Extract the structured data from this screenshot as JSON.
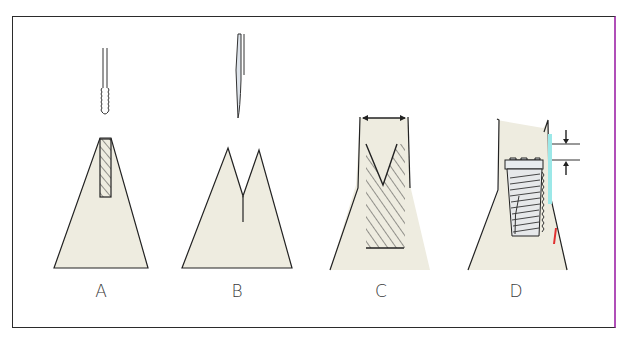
{
  "figure": {
    "panels": [
      {
        "id": "A",
        "label": "A",
        "description": "Narrow bone ridge with pilot osteotomy and drill/tap above"
      },
      {
        "id": "B",
        "label": "B",
        "description": "Ridge split with chisel/osteotome creating V-shaped split"
      },
      {
        "id": "C",
        "label": "C",
        "description": "Expanded ridge with widened width indicated by double-headed arrow and hatched osteotomy"
      },
      {
        "id": "D",
        "label": "D",
        "description": "Tapered threaded implant placed in expanded ridge with subcrestal depth arrows"
      }
    ],
    "colors": {
      "bone_fill": "#eeece0",
      "line": "#222222",
      "frame_border": "#2b2b2b",
      "frame_right_border": "#b04fb8",
      "implant_fill": "#e6e8ea",
      "cyan_artifact": "#7fe0e0",
      "red_artifact": "#e03030"
    }
  }
}
